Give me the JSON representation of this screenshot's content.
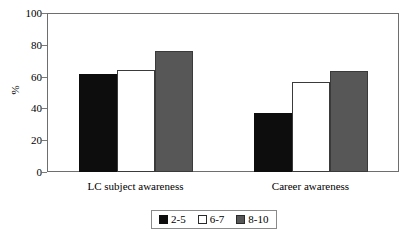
{
  "chart_data": {
    "type": "bar",
    "title": "",
    "xlabel": "",
    "ylabel": "%",
    "ylim": [
      0,
      100
    ],
    "yticks": [
      0,
      20,
      40,
      60,
      80,
      100
    ],
    "grid": false,
    "legend_position": "bottom",
    "categories": [
      "LC subject awareness",
      "Career awareness"
    ],
    "series": [
      {
        "name": "2-5",
        "color": "#0d0d0d",
        "values": [
          62,
          38
        ]
      },
      {
        "name": "6-7",
        "color": "#ffffff",
        "values": [
          65,
          57
        ]
      },
      {
        "name": "8-10",
        "color": "#575757",
        "values": [
          77,
          64
        ]
      }
    ]
  },
  "axis": {
    "y_title": "%",
    "tick_labels": [
      "100",
      "80",
      "60",
      "40",
      "20",
      "0"
    ]
  },
  "categories": {
    "label_0": "LC subject awareness",
    "label_1": "Career awareness"
  },
  "legend": {
    "items": [
      {
        "label": "2-5"
      },
      {
        "label": "6-7"
      },
      {
        "label": "8-10"
      }
    ]
  },
  "colors": {
    "series_0": "#0d0d0d",
    "series_1": "#ffffff",
    "series_2": "#575757",
    "frame": "#6e6e6e",
    "background": "#ffffff"
  }
}
